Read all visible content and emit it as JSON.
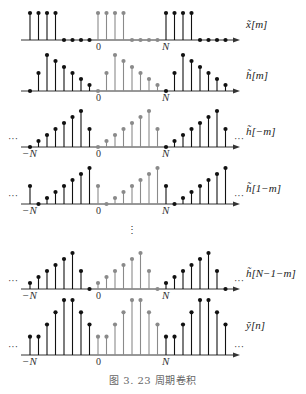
{
  "caption": "图 3. 23   周期卷积",
  "vertical_ellipsis": "⋮",
  "chart_data": [
    {
      "type": "stem",
      "label": "x̃[m]",
      "period_N": 8,
      "index_range": [
        -8,
        15
      ],
      "base_period_values": [
        1,
        1,
        1,
        1,
        0,
        0,
        0,
        0
      ],
      "tick_labels": [
        "0",
        "N"
      ],
      "ellipsis": false
    },
    {
      "type": "stem",
      "label": "h̃[m]",
      "period_N": 8,
      "index_range": [
        -8,
        15
      ],
      "base_period_values": [
        0,
        3,
        6,
        5,
        4,
        3,
        2,
        1
      ],
      "tick_labels": [
        "0",
        "N"
      ],
      "ellipsis": false
    },
    {
      "type": "stem",
      "label": "h̃[−m]",
      "period_N": 8,
      "index_range": [
        -8,
        15
      ],
      "base_period_values": [
        0,
        1,
        2,
        3,
        4,
        5,
        6,
        3
      ],
      "tick_labels": [
        "−N",
        "0",
        "N"
      ],
      "ellipsis": true
    },
    {
      "type": "stem",
      "label": "h̃[1−m]",
      "period_N": 8,
      "index_range": [
        -8,
        15
      ],
      "base_period_values": [
        3,
        0,
        1,
        2,
        3,
        4,
        5,
        6
      ],
      "tick_labels": [
        "−N",
        "0",
        "N"
      ],
      "ellipsis": true
    },
    {
      "type": "stem",
      "label": "h̃[N−1−m]",
      "period_N": 8,
      "index_range": [
        -8,
        15
      ],
      "base_period_values": [
        1,
        2,
        3,
        4,
        5,
        6,
        3,
        0
      ],
      "tick_labels": [
        "−N",
        "0",
        "N"
      ],
      "ellipsis": true
    },
    {
      "type": "stem",
      "label": "ỹ[n]",
      "period_N": 8,
      "index_range": [
        -8,
        15
      ],
      "base_period_values": [
        6,
        6,
        10,
        14,
        18,
        18,
        14,
        10
      ],
      "tick_labels": [
        "−N",
        "0",
        "N"
      ],
      "ellipsis": true
    }
  ],
  "colors": {
    "main": "#111111",
    "base_period": "#8a8a8a",
    "axis": "#333333"
  }
}
